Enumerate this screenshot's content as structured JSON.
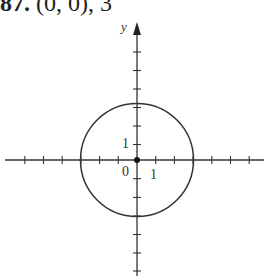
{
  "problem": {
    "number": "87.",
    "text": "(0, 0), 3"
  },
  "graph": {
    "y_axis_label": "y",
    "origin_label": "0",
    "x_tick_label": "1",
    "y_tick_label": "1",
    "center": [
      0,
      0
    ],
    "radius": 3,
    "origin_px": [
      137,
      160
    ],
    "unit_px": 18.7,
    "x_ticks": [
      -6,
      -5,
      -4,
      -3,
      -2,
      -1,
      1,
      2,
      3,
      4,
      5,
      6
    ],
    "y_ticks": [
      -6,
      -5,
      -4,
      -3,
      -2,
      -1,
      1,
      2,
      3,
      4,
      5,
      6
    ],
    "line_color": "#333333"
  }
}
